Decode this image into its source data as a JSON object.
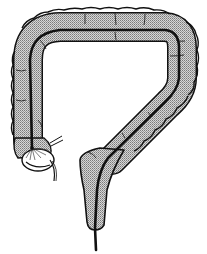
{
  "figure": {
    "colors": {
      "background": "#ffffff",
      "outline": "#111111",
      "fill_stipple_dark": "#7a7a7a",
      "fill_stipple_light": "#d8d8d8"
    },
    "parts": [
      {
        "name": "ascending-colon"
      },
      {
        "name": "transverse-colon"
      },
      {
        "name": "descending-colon"
      },
      {
        "name": "sigmoid-rectum"
      },
      {
        "name": "cecum-end"
      },
      {
        "name": "central-tube"
      }
    ]
  }
}
